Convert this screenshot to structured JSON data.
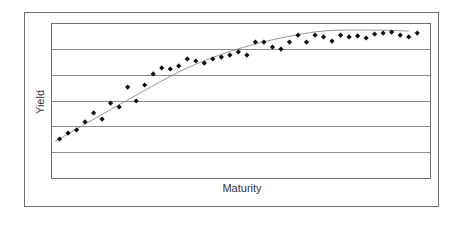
{
  "chart_data": {
    "type": "scatter",
    "title": "",
    "xlabel": "Maturity",
    "ylabel": "Yield",
    "ylim": [
      0,
      6
    ],
    "grid": true,
    "legend": null,
    "tick_labels_shown": false,
    "series": [
      {
        "name": "Observed yields",
        "kind": "scatter",
        "marker": "diamond",
        "color": "#111111",
        "x": [
          1,
          2,
          3,
          4,
          5,
          6,
          7,
          8,
          9,
          10,
          11,
          12,
          13,
          14,
          15,
          16,
          17,
          18,
          19,
          20,
          21,
          22,
          23,
          24,
          25,
          26,
          27,
          28,
          29,
          30,
          31,
          32,
          33,
          34,
          35,
          36,
          37,
          38,
          39,
          40,
          41,
          42,
          43
        ],
        "values": [
          1.51,
          1.74,
          1.86,
          2.17,
          2.52,
          2.28,
          2.9,
          2.75,
          3.52,
          2.98,
          3.6,
          4.03,
          4.26,
          4.22,
          4.34,
          4.61,
          4.53,
          4.45,
          4.61,
          4.68,
          4.76,
          4.88,
          4.76,
          5.26,
          5.26,
          5.07,
          4.99,
          5.26,
          5.53,
          5.26,
          5.53,
          5.46,
          5.3,
          5.53,
          5.46,
          5.5,
          5.42,
          5.57,
          5.61,
          5.65,
          5.53,
          5.46,
          5.61
        ]
      },
      {
        "name": "Fitted yield curve",
        "kind": "line",
        "color": "#777777",
        "x": [
          0.5,
          9,
          16,
          22,
          27,
          32,
          37,
          42
        ],
        "values": [
          1.42,
          3.02,
          4.26,
          5.0,
          5.42,
          5.69,
          5.73,
          5.69
        ]
      }
    ]
  },
  "labels": {
    "x_axis": "Maturity",
    "y_axis": "Yield"
  },
  "layout": {
    "plot": {
      "left": 51,
      "top": 23,
      "right": 430,
      "bottom": 178
    },
    "x_domain": [
      0,
      44.5
    ],
    "gridline_count": 5
  }
}
